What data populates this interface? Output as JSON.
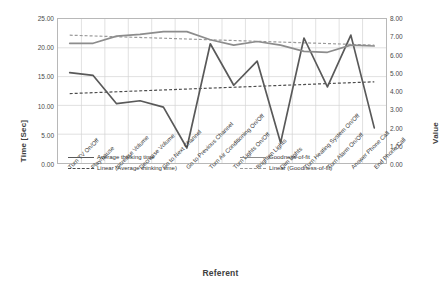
{
  "chart_data": {
    "type": "line",
    "title": "",
    "xlabel": "Referent",
    "ylabel": "Time [Sec]",
    "y2label": "Value",
    "grid": true,
    "legend_position": "inside-bottom",
    "categories": [
      "Turn TV On/Off",
      "Play/pause",
      "Increase Volume",
      "Decrease Volume",
      "Go to Next Channel",
      "Go to Previous Channel",
      "Turn Air Conditioning On/Off",
      "Turn Lights On/Off",
      "Brighten Lights",
      "Dim Lights",
      "Turn Heating System On/Off",
      "Turn Alarm On/Off",
      "Answer Phone Call",
      "End Phone Call"
    ],
    "ylim": [
      0,
      25
    ],
    "yticks": [
      "0.00",
      "5.00",
      "10.00",
      "15.00",
      "20.00",
      "25.00"
    ],
    "ytick_values": [
      0,
      5,
      10,
      15,
      20,
      25
    ],
    "y2lim": [
      0,
      8
    ],
    "y2ticks": [
      "0.00",
      "1.00",
      "2.00",
      "3.00",
      "4.00",
      "5.00",
      "6.00",
      "7.00",
      "8.00"
    ],
    "y2tick_values": [
      0,
      1,
      2,
      3,
      4,
      5,
      6,
      7,
      8
    ],
    "series": [
      {
        "name": "Average thinking time",
        "axis": "left",
        "style": "solid",
        "color": "#595959",
        "values": [
          15.7,
          15.2,
          10.3,
          10.8,
          9.7,
          2.6,
          20.7,
          13.5,
          17.7,
          3.5,
          21.7,
          13.2,
          22.2,
          6.1
        ]
      },
      {
        "name": "Goodness-of-fit",
        "axis": "right",
        "style": "solid",
        "color": "#8c8c8c",
        "values": [
          6.65,
          6.65,
          7.05,
          7.15,
          7.3,
          7.3,
          6.85,
          6.55,
          6.75,
          6.55,
          6.2,
          6.15,
          6.55,
          6.5
        ]
      },
      {
        "name": "Linear (Average thinking time)",
        "axis": "left",
        "style": "dashed",
        "color": "#4d4d4d",
        "trend_endpoints": [
          12.05,
          14.1
        ]
      },
      {
        "name": "Linear (Goodness-of-fit)",
        "axis": "right",
        "style": "dashed",
        "color": "#9a9a9a",
        "trend_endpoints": [
          7.1,
          6.55
        ]
      }
    ]
  },
  "axes": {
    "y_left_title": "Time [Sec]",
    "y_right_title": "Value",
    "x_title": "Referent"
  },
  "legend": {
    "items": [
      {
        "label": "Average thinking time"
      },
      {
        "label": "Goodness-of-fit"
      },
      {
        "label": "Linear (Average thinking time)"
      },
      {
        "label": "Linear (Goodness-of-fit)"
      }
    ]
  }
}
